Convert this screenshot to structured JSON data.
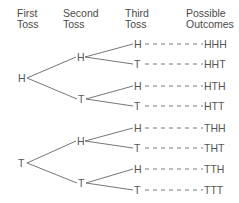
{
  "headers": {
    "first": [
      "First",
      "Toss"
    ],
    "second": [
      "Second",
      "Toss"
    ],
    "third": [
      "Third",
      "Toss"
    ],
    "outcomes": [
      "Possible",
      "Outcomes"
    ]
  },
  "tree": {
    "root": [
      {
        "label": "H",
        "x": 18,
        "y": 78
      },
      {
        "label": "T",
        "x": 18,
        "y": 163
      }
    ],
    "second": [
      {
        "label": "H",
        "x": 77,
        "y": 57,
        "parent": 0
      },
      {
        "label": "T",
        "x": 78,
        "y": 99,
        "parent": 0
      },
      {
        "label": "H",
        "x": 77,
        "y": 141,
        "parent": 1
      },
      {
        "label": "T",
        "x": 78,
        "y": 183,
        "parent": 1
      }
    ],
    "third": [
      {
        "label": "H",
        "y": 44,
        "parent": 0,
        "outcome": "HHH"
      },
      {
        "label": "T",
        "y": 64,
        "parent": 0,
        "outcome": "HHT"
      },
      {
        "label": "H",
        "y": 86,
        "parent": 1,
        "outcome": "HTH"
      },
      {
        "label": "T",
        "y": 106,
        "parent": 1,
        "outcome": "HTT"
      },
      {
        "label": "H",
        "y": 128,
        "parent": 2,
        "outcome": "THH"
      },
      {
        "label": "T",
        "y": 148,
        "parent": 2,
        "outcome": "THT"
      },
      {
        "label": "H",
        "y": 169,
        "parent": 3,
        "outcome": "TTH"
      },
      {
        "label": "T",
        "y": 190,
        "parent": 3,
        "outcome": "TTT"
      }
    ]
  },
  "colors": {
    "line": "#666666",
    "text": "#555555"
  }
}
